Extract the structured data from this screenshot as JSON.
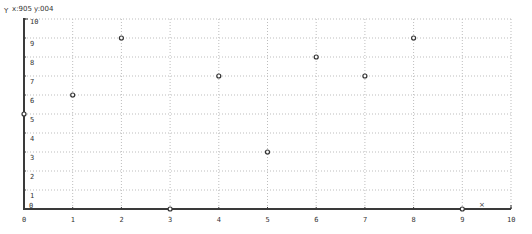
{
  "header": {
    "y_axis_name": "Y",
    "coord_readout": "x:905  y:004"
  },
  "x_marker": "×",
  "colors": {
    "axis": "#3a3a3a",
    "grid": "#bdbdbd",
    "point": "#333333",
    "text": "#333333"
  },
  "chart_data": {
    "type": "scatter",
    "title": "",
    "xlabel": "X",
    "ylabel": "Y",
    "xlim": [
      0,
      10
    ],
    "ylim": [
      0,
      10
    ],
    "grid": true,
    "x_ticks": [
      0,
      1,
      2,
      3,
      4,
      5,
      6,
      7,
      8,
      9,
      10
    ],
    "y_ticks": [
      0,
      1,
      2,
      3,
      4,
      5,
      6,
      7,
      8,
      9,
      10
    ],
    "points": [
      {
        "x": 0,
        "y": 5
      },
      {
        "x": 1,
        "y": 6
      },
      {
        "x": 2,
        "y": 9
      },
      {
        "x": 3,
        "y": 0
      },
      {
        "x": 4,
        "y": 7
      },
      {
        "x": 5,
        "y": 3
      },
      {
        "x": 6,
        "y": 8
      },
      {
        "x": 7,
        "y": 7
      },
      {
        "x": 8,
        "y": 9
      },
      {
        "x": 9,
        "y": 0
      }
    ]
  }
}
